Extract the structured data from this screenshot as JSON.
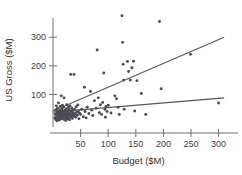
{
  "chart_data": {
    "type": "scatter",
    "title": "",
    "xlabel": "Budget ($M)",
    "ylabel": "US Gross ($M)",
    "xlim": [
      0,
      310
    ],
    "ylim": [
      0,
      390
    ],
    "xticks": [
      50,
      100,
      150,
      200,
      250,
      300
    ],
    "yticks": [
      100,
      200,
      300
    ],
    "grid": false,
    "legend": "none",
    "series": [
      {
        "name": "Films",
        "points": [
          [
            3,
            18
          ],
          [
            4,
            30
          ],
          [
            5,
            12
          ],
          [
            5,
            46
          ],
          [
            6,
            22
          ],
          [
            6,
            60
          ],
          [
            7,
            35
          ],
          [
            7,
            8
          ],
          [
            8,
            28
          ],
          [
            8,
            52
          ],
          [
            9,
            16
          ],
          [
            9,
            40
          ],
          [
            10,
            25
          ],
          [
            10,
            70
          ],
          [
            11,
            33
          ],
          [
            11,
            10
          ],
          [
            12,
            44
          ],
          [
            12,
            20
          ],
          [
            13,
            58
          ],
          [
            13,
            30
          ],
          [
            14,
            15
          ],
          [
            14,
            38
          ],
          [
            15,
            27
          ],
          [
            15,
            95
          ],
          [
            16,
            48
          ],
          [
            16,
            19
          ],
          [
            17,
            34
          ],
          [
            17,
            62
          ],
          [
            18,
            24
          ],
          [
            18,
            41
          ],
          [
            19,
            13
          ],
          [
            19,
            55
          ],
          [
            20,
            30
          ],
          [
            20,
            88
          ],
          [
            21,
            36
          ],
          [
            21,
            17
          ],
          [
            22,
            45
          ],
          [
            22,
            26
          ],
          [
            23,
            32
          ],
          [
            23,
            9
          ],
          [
            24,
            50
          ],
          [
            24,
            21
          ],
          [
            25,
            38
          ],
          [
            25,
            64
          ],
          [
            26,
            29
          ],
          [
            26,
            14
          ],
          [
            27,
            42
          ],
          [
            27,
            23
          ],
          [
            28,
            56
          ],
          [
            28,
            31
          ],
          [
            29,
            18
          ],
          [
            29,
            47
          ],
          [
            30,
            35
          ],
          [
            30,
            11
          ],
          [
            31,
            60
          ],
          [
            31,
            26
          ],
          [
            32,
            170
          ],
          [
            33,
            40
          ],
          [
            33,
            22
          ],
          [
            34,
            52
          ],
          [
            34,
            30
          ],
          [
            35,
            16
          ],
          [
            35,
            44
          ],
          [
            36,
            28
          ],
          [
            37,
            36
          ],
          [
            38,
            170
          ],
          [
            38,
            24
          ],
          [
            39,
            48
          ],
          [
            40,
            32
          ],
          [
            41,
            20
          ],
          [
            42,
            57
          ],
          [
            43,
            38
          ],
          [
            44,
            27
          ],
          [
            45,
            63
          ],
          [
            46,
            42
          ],
          [
            47,
            15
          ],
          [
            48,
            34
          ],
          [
            50,
            30
          ],
          [
            52,
            48
          ],
          [
            55,
            22
          ],
          [
            57,
            125
          ],
          [
            58,
            40
          ],
          [
            60,
            18
          ],
          [
            62,
            55
          ],
          [
            65,
            33
          ],
          [
            68,
            110
          ],
          [
            70,
            45
          ],
          [
            72,
            26
          ],
          [
            75,
            78
          ],
          [
            78,
            52
          ],
          [
            80,
            255
          ],
          [
            82,
            88
          ],
          [
            84,
            36
          ],
          [
            86,
            64
          ],
          [
            88,
            30
          ],
          [
            90,
            72
          ],
          [
            92,
            175
          ],
          [
            94,
            48
          ],
          [
            95,
            20
          ],
          [
            96,
            58
          ],
          [
            98,
            40
          ],
          [
            100,
            62
          ],
          [
            105,
            35
          ],
          [
            112,
            95
          ],
          [
            115,
            85
          ],
          [
            118,
            55
          ],
          [
            120,
            30
          ],
          [
            125,
            375
          ],
          [
            126,
            282
          ],
          [
            127,
            205
          ],
          [
            128,
            150
          ],
          [
            129,
            48
          ],
          [
            135,
            215
          ],
          [
            137,
            180
          ],
          [
            140,
            150
          ],
          [
            143,
            193
          ],
          [
            146,
            216
          ],
          [
            148,
            42
          ],
          [
            152,
            148
          ],
          [
            160,
            103
          ],
          [
            168,
            30
          ],
          [
            193,
            355
          ],
          [
            196,
            120
          ],
          [
            249,
            240
          ],
          [
            300,
            70
          ]
        ]
      }
    ],
    "fit_lines": [
      {
        "name": "upper-fit",
        "x0": 0,
        "y0": 42,
        "x1": 310,
        "y1": 300,
        "description": "steeper regression line"
      },
      {
        "name": "lower-fit",
        "x0": 0,
        "y0": 38,
        "x1": 310,
        "y1": 88,
        "description": "shallower regression line"
      }
    ]
  }
}
